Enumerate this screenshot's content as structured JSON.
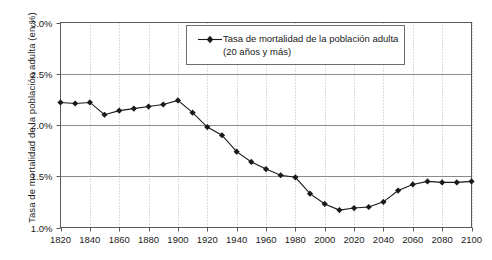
{
  "chart_data": {
    "type": "line",
    "title": "",
    "xlabel": "",
    "ylabel": "Tasa de mortalidad de la población adulta (en %)",
    "xlim": [
      1820,
      2100
    ],
    "ylim": [
      1.0,
      3.0
    ],
    "ytick_labels": [
      "3.0%",
      "2.5%",
      "2.0%",
      "1.5%",
      "1.0%"
    ],
    "ytick_values": [
      3.0,
      2.5,
      2.0,
      1.5,
      1.0
    ],
    "xtick_labels": [
      "1820",
      "1840",
      "1860",
      "1880",
      "1900",
      "1920",
      "1940",
      "1960",
      "1980",
      "2000",
      "2020",
      "2040",
      "2060",
      "2080",
      "2100"
    ],
    "xtick_values": [
      1820,
      1840,
      1860,
      1880,
      1900,
      1920,
      1940,
      1960,
      1980,
      2000,
      2020,
      2040,
      2060,
      2080,
      2100
    ],
    "grid": "vertical-dotted-and-horizontal-solid",
    "legend_position": "top-center",
    "series": [
      {
        "name": "Tasa de mortalidad de la población adulta (20 años y más)",
        "color": "#1a1a1a",
        "marker": "diamond",
        "x": [
          1820,
          1830,
          1840,
          1850,
          1860,
          1870,
          1880,
          1890,
          1900,
          1910,
          1920,
          1930,
          1940,
          1950,
          1960,
          1970,
          1980,
          1990,
          2000,
          2010,
          2020,
          2030,
          2040,
          2050,
          2060,
          2070,
          2080,
          2090,
          2100
        ],
        "values": [
          2.22,
          2.21,
          2.22,
          2.1,
          2.14,
          2.16,
          2.18,
          2.2,
          2.24,
          2.12,
          1.98,
          1.9,
          1.74,
          1.64,
          1.57,
          1.51,
          1.49,
          1.33,
          1.23,
          1.17,
          1.19,
          1.2,
          1.25,
          1.36,
          1.42,
          1.45,
          1.44,
          1.44,
          1.45
        ]
      }
    ]
  },
  "legend": {
    "line1": "Tasa de mortalidad de la población adulta",
    "line2": "(20 años y más)"
  }
}
